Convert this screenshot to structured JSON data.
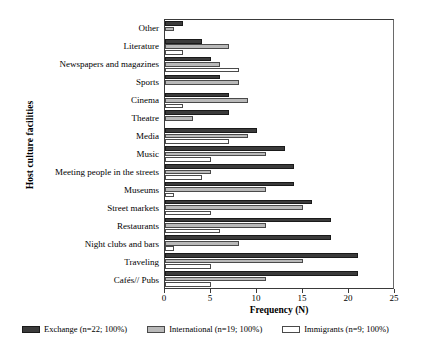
{
  "chart_data": {
    "type": "bar",
    "orientation": "horizontal",
    "title": "",
    "xlabel": "Frequency (N)",
    "ylabel": "Host culture facilities",
    "xlim": [
      0,
      25
    ],
    "xticks": [
      0,
      5,
      10,
      15,
      20,
      25
    ],
    "xtick_labels": [
      "0",
      "5",
      "10",
      "15",
      "20",
      "25"
    ],
    "grid": false,
    "legend_position": "bottom",
    "categories": [
      "Other",
      "Literature",
      "Newspapers and magazines",
      "Sports",
      "Cinema",
      "Theatre",
      "Media",
      "Music",
      "Meeting people in the streets",
      "Museums",
      "Street markets",
      "Restaurants",
      "Night clubs and bars",
      "Traveling",
      "Cafés// Pubs"
    ],
    "series": [
      {
        "name": "Exchange (n=22; 100%)",
        "short_name": "Exchange",
        "color": "#3b3b3b",
        "values": [
          2,
          4,
          5,
          6,
          7,
          7,
          10,
          13,
          14,
          14,
          16,
          18,
          18,
          21,
          21
        ]
      },
      {
        "name": "International (n=19; 100%)",
        "short_name": "International",
        "color": "#b9b9b9",
        "values": [
          1,
          7,
          6,
          8,
          9,
          3,
          9,
          11,
          5,
          11,
          15,
          11,
          8,
          15,
          11
        ]
      },
      {
        "name": "Immigrants (n=9; 100%)",
        "short_name": "Immigrants",
        "color": "#ffffff",
        "values": [
          0,
          2,
          8,
          0,
          2,
          0,
          7,
          5,
          4,
          1,
          5,
          6,
          1,
          5,
          5
        ]
      }
    ]
  },
  "legend": {
    "items": [
      {
        "label": "Exchange (n=22; 100%)"
      },
      {
        "label": "International (n=19; 100%)"
      },
      {
        "label": "Immigrants (n=9; 100%)"
      }
    ]
  },
  "axes": {
    "x_title": "Frequency (N)",
    "y_title": "Host culture facilities"
  }
}
